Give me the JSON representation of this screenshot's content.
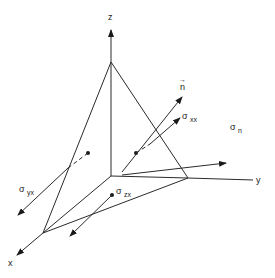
{
  "diagram": {
    "type": "tetrahedron-stress-element",
    "axes": {
      "z": {
        "label": "z"
      },
      "y": {
        "label": "y"
      },
      "x": {
        "label": "x"
      }
    },
    "vectors": {
      "normal": {
        "label": "n",
        "accent": "→"
      },
      "sigma_xx": {
        "symbol": "σ",
        "subscript": "xx"
      },
      "sigma_n": {
        "symbol": "σ",
        "subscript": "n"
      },
      "sigma_yx": {
        "symbol": "σ",
        "subscript": "yx"
      },
      "sigma_zx": {
        "symbol": "σ",
        "subscript": "zx"
      }
    },
    "colors": {
      "stroke": "#2a2a2a",
      "background": "#ffffff"
    }
  }
}
